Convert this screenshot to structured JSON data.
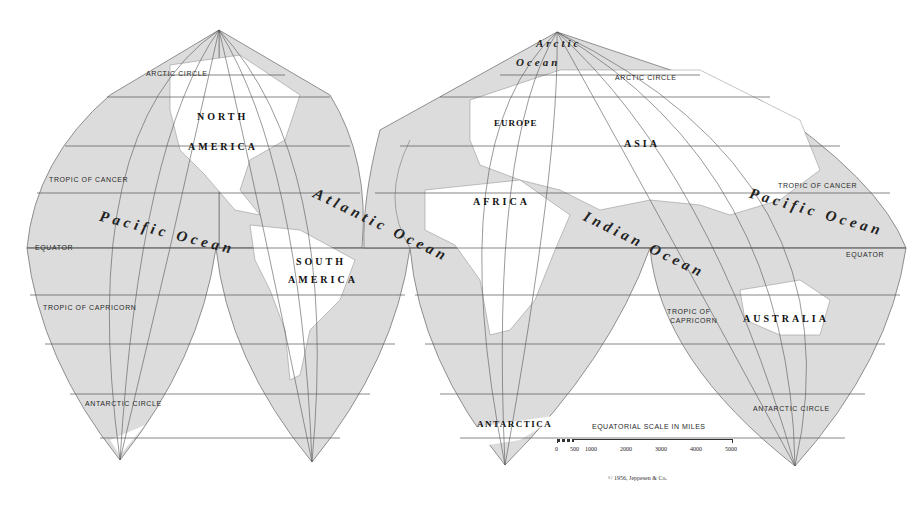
{
  "map": {
    "title": "Goode-style interrupted world map",
    "colors": {
      "ocean": "#dcdcdc",
      "land": "#ffffff",
      "grid": "#555555",
      "text": "#222222"
    },
    "lines": {
      "arctic_circle_left": "ARCTIC CIRCLE",
      "arctic_circle_right": "ARCTIC CIRCLE",
      "tropic_cancer_left": "TROPIC OF CANCER",
      "tropic_cancer_right": "TROPIC OF CANCER",
      "equator_left": "EQUATOR",
      "equator_right": "EQUATOR",
      "tropic_capricorn_left": "TROPIC OF CAPRICORN",
      "tropic_capricorn_right_1": "TROPIC OF",
      "tropic_capricorn_right_2": "CAPRICORN",
      "antarctic_circle_left": "ANTARCTIC CIRCLE",
      "antarctic_circle_right": "ANTARCTIC CIRCLE"
    },
    "continents": {
      "north_america_1": "NORTH",
      "north_america_2": "AMERICA",
      "south_america_1": "SOUTH",
      "south_america_2": "AMERICA",
      "europe": "EUROPE",
      "asia": "ASIA",
      "africa": "AFRICA",
      "australia": "AUSTRALIA",
      "antarctica": "ANTARCTICA"
    },
    "oceans": {
      "pacific_left": "Pacific Ocean",
      "pacific_right": "Pacific Ocean",
      "atlantic": "Atlantic Ocean",
      "indian": "Indian Ocean",
      "arctic_1": "Arctic",
      "arctic_2": "Ocean"
    },
    "scale": {
      "title": "EQUATORIAL SCALE IN MILES",
      "ticks": [
        "0",
        "500",
        "1000",
        "2000",
        "3000",
        "4000",
        "5000"
      ]
    },
    "copyright": "© 1956, Jeppesen & Co."
  }
}
